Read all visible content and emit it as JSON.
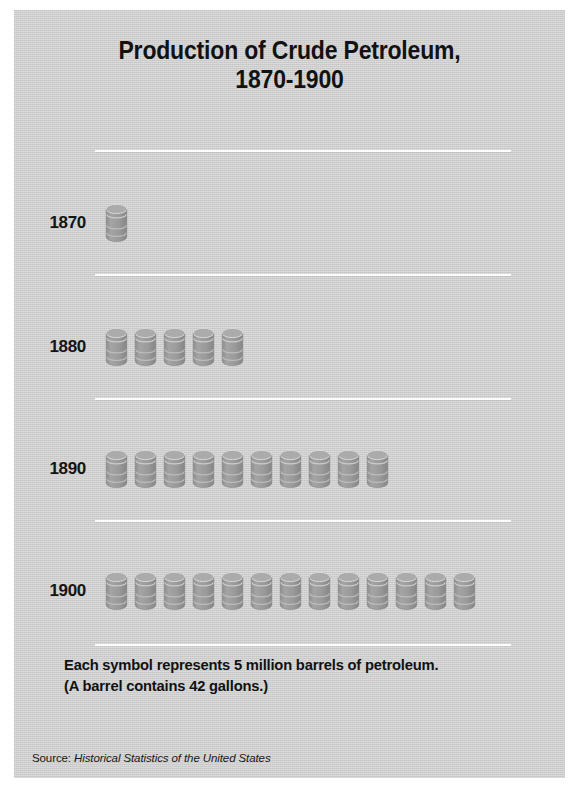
{
  "poster": {
    "title_line1": "Production of Crude Petroleum,",
    "title_line2": "1870-1900",
    "background_color": "#cdcdcd",
    "symbol_color": "#999999",
    "rule_color": "#fdfdfd",
    "text_color": "#121212"
  },
  "footnote": {
    "line1": "Each symbol represents 5 million barrels of petroleum.",
    "line2": "(A barrel contains 42 gallons.)"
  },
  "source": {
    "prefix": "Source:",
    "title": "Historical Statistics of the United States"
  },
  "chart_data": {
    "type": "bar",
    "subtype": "pictograph",
    "title": "Production of Crude Petroleum, 1870-1900",
    "xlabel": "",
    "ylabel": "",
    "unit_label": "Each symbol represents 5 million barrels of petroleum.",
    "symbol_name": "barrel-icon",
    "symbol_value": 5,
    "symbol_value_unit": "million barrels",
    "categories": [
      "1870",
      "1880",
      "1890",
      "1900"
    ],
    "symbol_counts": [
      1,
      5,
      10,
      13
    ],
    "values": [
      5,
      25,
      50,
      65
    ],
    "value_unit": "million barrels",
    "xlim": [
      0,
      65
    ],
    "grid": false,
    "legend": "none",
    "rows": [
      {
        "label": "1870",
        "symbols": 1,
        "value": 5
      },
      {
        "label": "1880",
        "symbols": 5,
        "value": 25
      },
      {
        "label": "1890",
        "symbols": 10,
        "value": 50
      },
      {
        "label": "1900",
        "symbols": 13,
        "value": 65
      }
    ]
  }
}
